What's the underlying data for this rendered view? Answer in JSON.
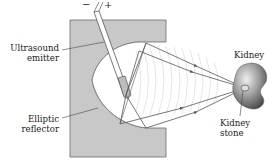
{
  "labels": {
    "emitter": [
      "Ultrasound",
      "emitter"
    ],
    "reflector": [
      "Elliptic",
      "reflector"
    ],
    "kidney": "Kidney",
    "stone": [
      "Kidney",
      "stone"
    ],
    "minus": "−",
    "plus": "+"
  },
  "icons": {
    "emitter": "ultrasound-emitter-rod",
    "reflector": "elliptic-reflector-block",
    "kidney": "kidney-shape",
    "stone": "kidney-stone-dot"
  },
  "colors": {
    "reflector_fill": "#c8c8c8",
    "reflector_stroke": "#6a6a6a",
    "ray": "#555555",
    "wave": "#d4d4d4",
    "kidney_light": "#e2e2e2",
    "kidney_dark": "#555555",
    "text": "#222222"
  }
}
